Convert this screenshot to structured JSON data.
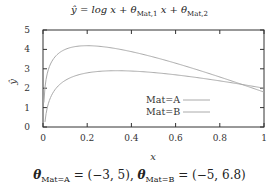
{
  "chart_data": {
    "type": "line",
    "xlabel": "x",
    "ylabel": "ŷ",
    "xlim": [
      0,
      1
    ],
    "ylim": [
      0,
      5
    ],
    "xticks": [
      "0",
      "0.2",
      "0.4",
      "0.6",
      "0.8",
      "1"
    ],
    "yticks": [
      "0",
      "1",
      "2",
      "3",
      "4",
      "5"
    ],
    "grid": false,
    "legend_position": "lower right",
    "series": [
      {
        "name": "Mat=A",
        "theta": [
          -3,
          5
        ],
        "x": [
          0.02,
          0.05,
          0.1,
          0.2,
          0.33,
          0.4,
          0.6,
          0.8,
          1.0
        ],
        "values": [
          1.03,
          1.85,
          2.4,
          2.79,
          2.9,
          2.88,
          2.69,
          2.38,
          2.0
        ]
      },
      {
        "name": "Mat=B",
        "theta": [
          -5,
          6.8
        ],
        "x": [
          0.02,
          0.05,
          0.1,
          0.2,
          0.3,
          0.4,
          0.6,
          0.8,
          1.0
        ],
        "values": [
          2.79,
          3.55,
          3.99,
          4.19,
          4.1,
          3.88,
          3.29,
          2.58,
          1.8
        ]
      }
    ],
    "caption": "θ_Mat=A = (−3, 5), θ_Mat=B = (−5, 6.8)"
  },
  "title": {
    "main": "ŷ = log x + θ",
    "sub1": "Mat,1",
    "mid": " x + θ",
    "sub2": "Mat,2"
  },
  "axes": {
    "xlabel": "x",
    "ylabel": "ŷ"
  },
  "legend": {
    "a": "Mat=A",
    "b": "Mat=B"
  },
  "caption": {
    "theta": "θ",
    "subA": "Mat=A",
    "valA": " = (−3, 5), ",
    "subB": "Mat=B",
    "valB": " = (−5, 6.8)"
  }
}
